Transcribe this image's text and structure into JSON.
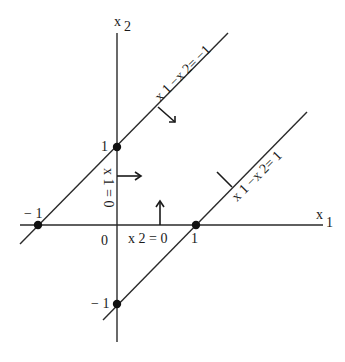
{
  "diagram": {
    "axes": {
      "x1_label": "x",
      "x1_sub": "1",
      "x2_label": "x",
      "x2_sub": "2",
      "origin_label": "0"
    },
    "ticks": {
      "x1_pos": "1",
      "x1_neg": "− 1",
      "x2_pos": "1",
      "x2_neg": "− 1"
    },
    "lines": [
      {
        "name": "upper-line",
        "equation": "x 1 −x 2 = −1",
        "text": "x 1 −x 2= −1"
      },
      {
        "name": "lower-line",
        "equation": "x 1 −x 2 = 1",
        "text": "x 1 −x 2= 1"
      }
    ],
    "constraints": {
      "x1_zero": "x 1 = 0",
      "x2_zero": "x 2 = 0"
    },
    "points": [
      {
        "label": "(-1,0)"
      },
      {
        "label": "(0,1)"
      },
      {
        "label": "(1,0)"
      },
      {
        "label": "(0,-1)"
      }
    ],
    "colors": {
      "ink": "#1a1a1a",
      "background": "#ffffff"
    }
  }
}
